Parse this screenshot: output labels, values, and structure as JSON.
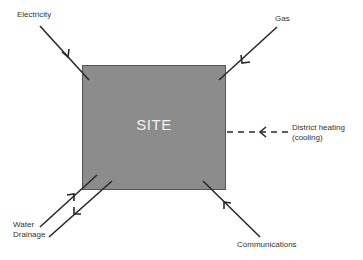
{
  "site": {
    "label": "SITE",
    "fill_color": "#8c8c8c"
  },
  "connections": [
    {
      "id": "electricity",
      "label": "Electricity",
      "direction": "in",
      "style": "solid"
    },
    {
      "id": "gas",
      "label": "Gas",
      "direction": "in",
      "style": "solid"
    },
    {
      "id": "district-heating",
      "label_line1": "District heating",
      "label_line2": "(cooling)",
      "direction": "in",
      "style": "dashed"
    },
    {
      "id": "water",
      "label": "Water",
      "direction": "in",
      "style": "solid"
    },
    {
      "id": "drainage",
      "label": "Drainage",
      "direction": "out",
      "style": "solid"
    },
    {
      "id": "communications",
      "label": "Communications",
      "direction": "in",
      "style": "solid"
    }
  ],
  "colors": {
    "line": "#2a2a2a",
    "text": "#333333",
    "site_text": "#f2f2f2"
  }
}
